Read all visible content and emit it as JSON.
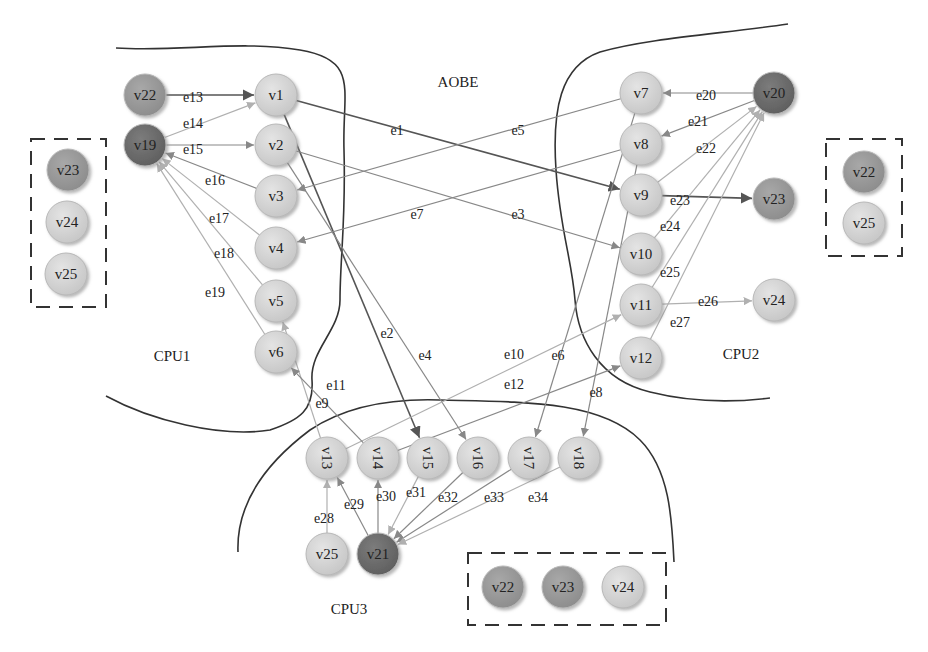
{
  "title": "AOBE",
  "regions": [
    {
      "id": "cpu1",
      "label": "CPU1",
      "x": 172,
      "y": 356
    },
    {
      "id": "cpu2",
      "label": "CPU2",
      "x": 741,
      "y": 354
    },
    {
      "id": "cpu3",
      "label": "CPU3",
      "x": 349,
      "y": 609
    },
    {
      "id": "aobe",
      "label": "AOBE",
      "x": 458,
      "y": 82
    }
  ],
  "colors": {
    "light": "#d4d4d4",
    "medium": "#9a9a9a",
    "dark": "#6e6e6e",
    "edge_dark": "#555555",
    "edge_mid": "#888888",
    "edge_light": "#b0b0b0",
    "boundary": "#333333"
  },
  "nodes": [
    {
      "id": "v1",
      "label": "v1",
      "x": 276,
      "y": 95,
      "shade": "light"
    },
    {
      "id": "v2",
      "label": "v2",
      "x": 276,
      "y": 145,
      "shade": "light"
    },
    {
      "id": "v3",
      "label": "v3",
      "x": 276,
      "y": 196,
      "shade": "light"
    },
    {
      "id": "v4",
      "label": "v4",
      "x": 276,
      "y": 248,
      "shade": "light"
    },
    {
      "id": "v5",
      "label": "v5",
      "x": 276,
      "y": 301,
      "shade": "light"
    },
    {
      "id": "v6",
      "label": "v6",
      "x": 276,
      "y": 352,
      "shade": "light"
    },
    {
      "id": "v7",
      "label": "v7",
      "x": 641,
      "y": 93,
      "shade": "light"
    },
    {
      "id": "v8",
      "label": "v8",
      "x": 641,
      "y": 144,
      "shade": "light"
    },
    {
      "id": "v9",
      "label": "v9",
      "x": 641,
      "y": 195,
      "shade": "light"
    },
    {
      "id": "v10",
      "label": "v10",
      "x": 641,
      "y": 254,
      "shade": "light"
    },
    {
      "id": "v11",
      "label": "v11",
      "x": 641,
      "y": 305,
      "shade": "light"
    },
    {
      "id": "v12",
      "label": "v12",
      "x": 641,
      "y": 358,
      "shade": "light"
    },
    {
      "id": "v13",
      "label": "v13",
      "x": 327,
      "y": 458,
      "shade": "light",
      "rotated": true
    },
    {
      "id": "v14",
      "label": "v14",
      "x": 378,
      "y": 458,
      "shade": "light",
      "rotated": true
    },
    {
      "id": "v15",
      "label": "v15",
      "x": 428,
      "y": 458,
      "shade": "light",
      "rotated": true
    },
    {
      "id": "v16",
      "label": "v16",
      "x": 478,
      "y": 458,
      "shade": "light",
      "rotated": true
    },
    {
      "id": "v17",
      "label": "v17",
      "x": 529,
      "y": 458,
      "shade": "light",
      "rotated": true
    },
    {
      "id": "v18",
      "label": "v18",
      "x": 579,
      "y": 458,
      "shade": "light",
      "rotated": true
    },
    {
      "id": "v19",
      "label": "v19",
      "x": 145,
      "y": 145,
      "shade": "dark"
    },
    {
      "id": "v20",
      "label": "v20",
      "x": 774,
      "y": 93,
      "shade": "dark"
    },
    {
      "id": "v21",
      "label": "v21",
      "x": 378,
      "y": 554,
      "shade": "dark"
    },
    {
      "id": "v22a",
      "label": "v22",
      "x": 145,
      "y": 95,
      "shade": "medium"
    },
    {
      "id": "v23a",
      "label": "v23",
      "x": 774,
      "y": 199,
      "shade": "medium"
    },
    {
      "id": "v24a",
      "label": "v24",
      "x": 774,
      "y": 300,
      "shade": "light"
    },
    {
      "id": "v25a",
      "label": "v25",
      "x": 327,
      "y": 554,
      "shade": "light"
    }
  ],
  "dashed_groups": [
    {
      "id": "group-cpu1",
      "x": 31,
      "y": 139,
      "w": 75,
      "h": 168,
      "nodes": [
        {
          "label": "v23",
          "x": 68,
          "y": 170,
          "shade": "medium"
        },
        {
          "label": "v24",
          "x": 67,
          "y": 222,
          "shade": "light"
        },
        {
          "label": "v25",
          "x": 66,
          "y": 274,
          "shade": "light"
        }
      ]
    },
    {
      "id": "group-cpu2",
      "x": 826,
      "y": 139,
      "w": 76,
      "h": 117,
      "nodes": [
        {
          "label": "v22",
          "x": 864,
          "y": 172,
          "shade": "medium"
        },
        {
          "label": "v25",
          "x": 864,
          "y": 223,
          "shade": "light"
        }
      ]
    },
    {
      "id": "group-cpu3",
      "x": 468,
      "y": 553,
      "w": 198,
      "h": 72,
      "nodes": [
        {
          "label": "v22",
          "x": 503,
          "y": 587,
          "shade": "medium"
        },
        {
          "label": "v23",
          "x": 563,
          "y": 587,
          "shade": "medium"
        },
        {
          "label": "v24",
          "x": 623,
          "y": 587,
          "shade": "light"
        }
      ]
    }
  ],
  "edges": [
    {
      "id": "e1",
      "from": "v1",
      "to": "v9",
      "label": "e1",
      "lx": 397,
      "ly": 130,
      "shade": "edge_dark"
    },
    {
      "id": "e2",
      "from": "v1",
      "to": "v15",
      "label": "e2",
      "lx": 387,
      "ly": 333,
      "shade": "edge_dark"
    },
    {
      "id": "e3",
      "from": "v2",
      "to": "v10",
      "label": "e3",
      "lx": 518,
      "ly": 214,
      "shade": "edge_mid"
    },
    {
      "id": "e4",
      "from": "v2",
      "to": "v16",
      "label": "e4",
      "lx": 425,
      "ly": 355,
      "shade": "edge_mid"
    },
    {
      "id": "e5",
      "from": "v7",
      "to": "v3",
      "label": "e5",
      "lx": 518,
      "ly": 130,
      "shade": "edge_mid"
    },
    {
      "id": "e6",
      "from": "v7",
      "to": "v17",
      "label": "e6",
      "lx": 558,
      "ly": 355,
      "shade": "edge_mid"
    },
    {
      "id": "e7",
      "from": "v8",
      "to": "v4",
      "label": "e7",
      "lx": 417,
      "ly": 214,
      "shade": "edge_mid"
    },
    {
      "id": "e8",
      "from": "v8",
      "to": "v18",
      "label": "e8",
      "lx": 596,
      "ly": 392,
      "shade": "edge_mid"
    },
    {
      "id": "e9",
      "from": "v13",
      "to": "v5",
      "label": "e9",
      "lx": 322,
      "ly": 403,
      "shade": "edge_light"
    },
    {
      "id": "e10",
      "from": "v13",
      "to": "v11",
      "label": "e10",
      "lx": 514,
      "ly": 354,
      "shade": "edge_light"
    },
    {
      "id": "e11",
      "from": "v14",
      "to": "v6",
      "label": "e11",
      "lx": 336,
      "ly": 385,
      "shade": "edge_mid"
    },
    {
      "id": "e12",
      "from": "v14",
      "to": "v12",
      "label": "e12",
      "lx": 514,
      "ly": 384,
      "shade": "edge_mid"
    },
    {
      "id": "e13",
      "from": "v22a",
      "to": "v1",
      "label": "e13",
      "lx": 193,
      "ly": 97,
      "shade": "edge_dark"
    },
    {
      "id": "e14",
      "from": "v19",
      "to": "v1",
      "label": "e14",
      "lx": 193,
      "ly": 123,
      "shade": "edge_light"
    },
    {
      "id": "e15",
      "from": "v19",
      "to": "v2",
      "label": "e15",
      "lx": 193,
      "ly": 149,
      "shade": "edge_mid"
    },
    {
      "id": "e16",
      "from": "v3",
      "to": "v19",
      "label": "e16",
      "lx": 215,
      "ly": 180,
      "shade": "edge_mid"
    },
    {
      "id": "e17",
      "from": "v4",
      "to": "v19",
      "label": "e17",
      "lx": 219,
      "ly": 218,
      "shade": "edge_light"
    },
    {
      "id": "e18",
      "from": "v5",
      "to": "v19",
      "label": "e18",
      "lx": 224,
      "ly": 253,
      "shade": "edge_light"
    },
    {
      "id": "e19",
      "from": "v6",
      "to": "v19",
      "label": "e19",
      "lx": 215,
      "ly": 292,
      "shade": "edge_light"
    },
    {
      "id": "e20",
      "from": "v20",
      "to": "v7",
      "label": "e20",
      "lx": 706,
      "ly": 95,
      "shade": "edge_mid"
    },
    {
      "id": "e21",
      "from": "v20",
      "to": "v8",
      "label": "e21",
      "lx": 698,
      "ly": 121,
      "shade": "edge_mid"
    },
    {
      "id": "e22",
      "from": "v9",
      "to": "v20",
      "label": "e22",
      "lx": 706,
      "ly": 148,
      "shade": "edge_light"
    },
    {
      "id": "e23",
      "from": "v9",
      "to": "v23a",
      "label": "e23",
      "lx": 680,
      "ly": 200,
      "shade": "edge_dark"
    },
    {
      "id": "e24",
      "from": "v10",
      "to": "v20",
      "label": "e24",
      "lx": 670,
      "ly": 226,
      "shade": "edge_light"
    },
    {
      "id": "e25",
      "from": "v11",
      "to": "v20",
      "label": "e25",
      "lx": 670,
      "ly": 272,
      "shade": "edge_light"
    },
    {
      "id": "e26",
      "from": "v11",
      "to": "v24a",
      "label": "e26",
      "lx": 708,
      "ly": 301,
      "shade": "edge_light"
    },
    {
      "id": "e27",
      "from": "v12",
      "to": "v20",
      "label": "e27",
      "lx": 680,
      "ly": 322,
      "shade": "edge_light"
    },
    {
      "id": "e28",
      "from": "v25a",
      "to": "v13",
      "label": "e28",
      "lx": 324,
      "ly": 518,
      "shade": "edge_light"
    },
    {
      "id": "e29",
      "from": "v21",
      "to": "v13",
      "label": "e29",
      "lx": 354,
      "ly": 504,
      "shade": "edge_mid"
    },
    {
      "id": "e30",
      "from": "v21",
      "to": "v14",
      "label": "e30",
      "lx": 386,
      "ly": 496,
      "shade": "edge_mid"
    },
    {
      "id": "e31",
      "from": "v15",
      "to": "v21",
      "label": "e31",
      "lx": 416,
      "ly": 492,
      "shade": "edge_light"
    },
    {
      "id": "e32",
      "from": "v16",
      "to": "v21",
      "label": "e32",
      "lx": 448,
      "ly": 497,
      "shade": "edge_mid"
    },
    {
      "id": "e33",
      "from": "v17",
      "to": "v21",
      "label": "e33",
      "lx": 494,
      "ly": 497,
      "shade": "edge_mid"
    },
    {
      "id": "e34",
      "from": "v18",
      "to": "v21",
      "label": "e34",
      "lx": 538,
      "ly": 497,
      "shade": "edge_light"
    }
  ],
  "boundaries": [
    {
      "id": "cpu1-boundary",
      "d": "M116,48 C180,52 240,40 300,50 C360,60 342,90 344,150 C346,220 340,260 340,300 C340,330 310,350 312,380 C314,410 300,420 270,430 C220,438 150,420 106,396"
    },
    {
      "id": "cpu2-boundary",
      "d": "M788,24 C720,34 650,38 600,52 C560,66 552,110 556,170 C560,230 572,260 575,300 C578,340 600,380 650,392 C690,402 730,403 770,398"
    },
    {
      "id": "cpu3-boundary",
      "d": "M238,552 C236,500 270,460 310,430 C340,410 380,398 440,400 C520,402 600,400 640,440 C670,470 672,520 674,562"
    }
  ]
}
